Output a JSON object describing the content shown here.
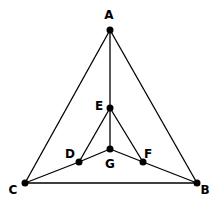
{
  "diagram": {
    "type": "graph",
    "nodes": [
      {
        "id": "A",
        "label": "A",
        "x": 110,
        "y": 30,
        "lx": 109,
        "ly": 19
      },
      {
        "id": "B",
        "label": "B",
        "x": 197,
        "y": 183,
        "lx": 205,
        "ly": 194
      },
      {
        "id": "C",
        "label": "C",
        "x": 25,
        "y": 183,
        "lx": 13,
        "ly": 194
      },
      {
        "id": "D",
        "label": "D",
        "x": 79,
        "y": 162,
        "lx": 70,
        "ly": 158
      },
      {
        "id": "E",
        "label": "E",
        "x": 110,
        "y": 108,
        "lx": 99,
        "ly": 110
      },
      {
        "id": "F",
        "label": "F",
        "x": 143,
        "y": 162,
        "lx": 148,
        "ly": 158
      },
      {
        "id": "G",
        "label": "G",
        "x": 110,
        "y": 149,
        "lx": 110,
        "ly": 168
      }
    ],
    "edges": [
      [
        "A",
        "C"
      ],
      [
        "A",
        "B"
      ],
      [
        "A",
        "E"
      ],
      [
        "C",
        "B"
      ],
      [
        "C",
        "D"
      ],
      [
        "D",
        "G"
      ],
      [
        "G",
        "F"
      ],
      [
        "F",
        "B"
      ],
      [
        "E",
        "D"
      ],
      [
        "E",
        "F"
      ],
      [
        "E",
        "G"
      ]
    ],
    "colors": {
      "line": "#000000",
      "node": "#000000",
      "background": "#ffffff"
    }
  }
}
